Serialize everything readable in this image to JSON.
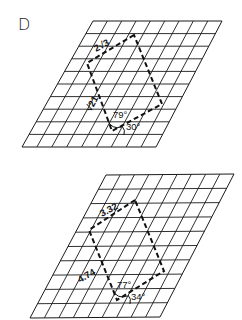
{
  "figure": {
    "panel_letter": "D",
    "background": "#ffffff",
    "ink_color": "#111111"
  },
  "lattices": [
    {
      "name": "top",
      "grid": {
        "rows": 10,
        "cols": 9,
        "corners": {
          "top_left": [
            93,
            21
          ],
          "top_right": [
            222,
            21
          ],
          "bottom_left": [
            22,
            147
          ],
          "bottom_right": [
            156,
            147
          ]
        },
        "skew_angle_label": "30°"
      },
      "unit_cell": {
        "vertices": [
          [
            134,
            35
          ],
          [
            87,
            63
          ],
          [
            112,
            131
          ],
          [
            162,
            104
          ]
        ],
        "edge_a_label": "2√3",
        "edge_b_label": "√21",
        "angle_label": "79°",
        "lattice_angle_label": "30°"
      }
    },
    {
      "name": "bottom",
      "grid": {
        "rows": 10,
        "cols": 9,
        "corners": {
          "top_left": [
            106,
            175
          ],
          "top_right": [
            234,
            174
          ],
          "bottom_left": [
            30,
            318
          ],
          "bottom_right": [
            160,
            317
          ]
        },
        "skew_angle_label": "34°"
      },
      "unit_cell": {
        "vertices": [
          [
            135,
            200
          ],
          [
            89,
            230
          ],
          [
            117,
            300
          ],
          [
            164,
            271
          ]
        ],
        "edge_a_label": "3.32",
        "edge_b_label": "4.74",
        "angle_label": "77°",
        "lattice_angle_label": "34°"
      }
    }
  ]
}
